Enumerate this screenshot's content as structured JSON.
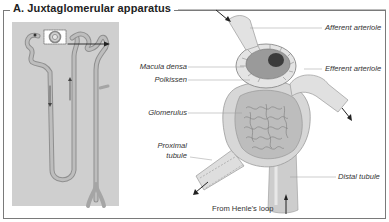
{
  "figure": {
    "title": "A. Juxtaglomerular apparatus",
    "colors": {
      "frame": "#7a7a7a",
      "panel_bg": "#cfcfcf",
      "tubule": "#b9b9b9",
      "tubule_dark": "#8a8a8a",
      "label_text": "#333333",
      "leader_line": "#999999"
    }
  },
  "overview_panel": {
    "description": "Nephron overview with highlighted juxtaglomerular region"
  },
  "labels": {
    "afferent_arteriole": "Afferent arteriole",
    "efferent_arteriole": "Efferent arteriole",
    "macula_densa": "Macula densa",
    "polkissen": "Polkissen",
    "glomerulus": "Glomerulus",
    "proximal_tubule_line1": "Proximal",
    "proximal_tubule_line2": "tubule",
    "distal_tubule": "Distal tubule",
    "from_henles_loop": "From Henle's loop"
  }
}
